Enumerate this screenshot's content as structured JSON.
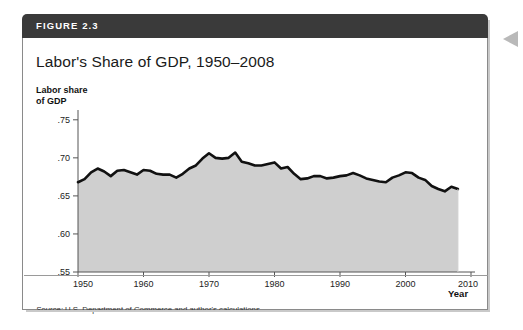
{
  "figure": {
    "header_label": "FIGURE 2.3",
    "title": "Labor's Share of GDP, 1950–2008",
    "source_label": "Source:",
    "source_text": " U.S. Department of Commerce and author's calculations."
  },
  "colors": {
    "header_band": "#3a3a3a",
    "border": "#8a8a8a",
    "area_fill": "#cfcfcf",
    "line": "#111111",
    "axis": "#555555",
    "page_arrow": "#b9b9b9"
  },
  "chart_data": {
    "type": "area",
    "title": "Labor's Share of GDP, 1950–2008",
    "xlabel": "Year",
    "ylabel": "Labor share of GDP",
    "xlim": [
      1950,
      2010
    ],
    "ylim": [
      0.55,
      0.755
    ],
    "grid": false,
    "legend": null,
    "xticks": [
      1950,
      1960,
      1970,
      1980,
      1990,
      2000,
      2010
    ],
    "xtick_labels": [
      "1950",
      "1960",
      "1970",
      "1980",
      "1990",
      "2000",
      "2010"
    ],
    "yticks": [
      0.55,
      0.6,
      0.65,
      0.7,
      0.75
    ],
    "ytick_labels": [
      ".55",
      ".60",
      ".65",
      ".70",
      ".75"
    ],
    "x": [
      1950,
      1951,
      1952,
      1953,
      1954,
      1955,
      1956,
      1957,
      1958,
      1959,
      1960,
      1961,
      1962,
      1963,
      1964,
      1965,
      1966,
      1967,
      1968,
      1969,
      1970,
      1971,
      1972,
      1973,
      1974,
      1975,
      1976,
      1977,
      1978,
      1979,
      1980,
      1981,
      1982,
      1983,
      1984,
      1985,
      1986,
      1987,
      1988,
      1989,
      1990,
      1991,
      1992,
      1993,
      1994,
      1995,
      1996,
      1997,
      1998,
      1999,
      2000,
      2001,
      2002,
      2003,
      2004,
      2005,
      2006,
      2007,
      2008
    ],
    "values": [
      0.668,
      0.672,
      0.681,
      0.686,
      0.682,
      0.676,
      0.683,
      0.684,
      0.681,
      0.678,
      0.684,
      0.683,
      0.679,
      0.678,
      0.678,
      0.674,
      0.679,
      0.686,
      0.69,
      0.699,
      0.706,
      0.7,
      0.699,
      0.7,
      0.707,
      0.695,
      0.693,
      0.69,
      0.69,
      0.692,
      0.694,
      0.686,
      0.688,
      0.679,
      0.672,
      0.673,
      0.676,
      0.676,
      0.673,
      0.674,
      0.676,
      0.677,
      0.68,
      0.677,
      0.673,
      0.671,
      0.669,
      0.668,
      0.674,
      0.677,
      0.681,
      0.68,
      0.674,
      0.671,
      0.663,
      0.659,
      0.656,
      0.662,
      0.659
    ],
    "series": [
      {
        "name": "Labor share of GDP",
        "values": [
          0.668,
          0.672,
          0.681,
          0.686,
          0.682,
          0.676,
          0.683,
          0.684,
          0.681,
          0.678,
          0.684,
          0.683,
          0.679,
          0.678,
          0.678,
          0.674,
          0.679,
          0.686,
          0.69,
          0.699,
          0.706,
          0.7,
          0.699,
          0.7,
          0.707,
          0.695,
          0.693,
          0.69,
          0.69,
          0.692,
          0.694,
          0.686,
          0.688,
          0.679,
          0.672,
          0.673,
          0.676,
          0.676,
          0.673,
          0.674,
          0.676,
          0.677,
          0.68,
          0.677,
          0.673,
          0.671,
          0.669,
          0.668,
          0.674,
          0.677,
          0.681,
          0.68,
          0.674,
          0.671,
          0.663,
          0.659,
          0.656,
          0.662,
          0.659
        ]
      }
    ]
  }
}
